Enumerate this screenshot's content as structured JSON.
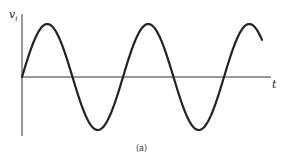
{
  "figure": {
    "y_axis_label": "v",
    "y_axis_subscript": "i",
    "x_axis_label": "t",
    "caption": "(a)",
    "stroke_color": "#222222"
  },
  "waveform": {
    "type": "sine",
    "cycles": 2.4,
    "origin_x": 22,
    "axis_y": 77,
    "amplitude_px": 53,
    "period_px": 101,
    "end_x": 262
  }
}
